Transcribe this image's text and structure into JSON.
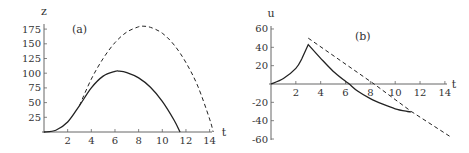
{
  "chart_data": [
    {
      "type": "line",
      "panel_label": "(a)",
      "xlabel": "t",
      "ylabel": "z",
      "xlim": [
        0,
        14.5
      ],
      "ylim": [
        0,
        180
      ],
      "x_ticks": [
        2,
        4,
        6,
        8,
        10,
        12,
        14
      ],
      "y_ticks": [
        25,
        50,
        75,
        100,
        125,
        150,
        175
      ],
      "grid": false,
      "series": [
        {
          "name": "solid",
          "style": "solid",
          "x": [
            0,
            1,
            2,
            3,
            4,
            5,
            6,
            6.3,
            7,
            8,
            9,
            10,
            11,
            11.5
          ],
          "y": [
            0,
            3,
            17,
            45,
            75,
            95,
            103,
            103.5,
            101,
            92,
            76,
            52,
            20,
            0
          ]
        },
        {
          "name": "dashed",
          "style": "dashed",
          "x": [
            3,
            4,
            5,
            6,
            7,
            8,
            8.3,
            9,
            10,
            11,
            12,
            13,
            14,
            14.3
          ],
          "y": [
            45,
            90,
            125,
            152,
            170,
            179,
            180,
            178,
            168,
            148,
            118,
            78,
            22,
            0
          ]
        }
      ]
    },
    {
      "type": "line",
      "panel_label": "(b)",
      "xlabel": "t",
      "ylabel": "u",
      "xlim": [
        0,
        14.5
      ],
      "ylim": [
        -60,
        60
      ],
      "x_ticks": [
        2,
        4,
        6,
        8,
        10,
        12,
        14
      ],
      "y_ticks": [
        60,
        40,
        20,
        -20,
        -40,
        -60
      ],
      "grid": false,
      "series": [
        {
          "name": "solid",
          "style": "solid",
          "x": [
            0,
            1,
            2,
            2.5,
            3,
            4,
            5,
            6,
            6.3,
            7,
            8,
            9,
            10,
            11,
            11.3
          ],
          "y": [
            0,
            6,
            17,
            28,
            43,
            28,
            14,
            3,
            0,
            -8,
            -16,
            -22,
            -27,
            -30,
            -30.5
          ]
        },
        {
          "name": "dashed",
          "style": "dashed",
          "x": [
            3,
            8.3,
            11.3,
            14.5
          ],
          "y": [
            50,
            0,
            -30,
            -58
          ]
        }
      ]
    }
  ]
}
